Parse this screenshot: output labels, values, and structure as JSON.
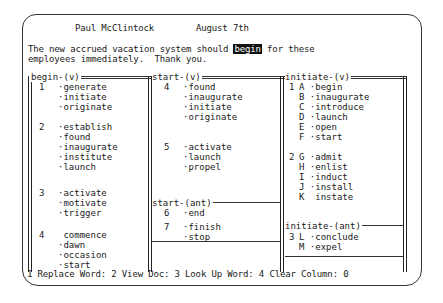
{
  "header": {
    "author": "Paul McClintock",
    "date": "August 7th"
  },
  "document": {
    "line1_before": "The new accrued vacation system should ",
    "highlighted_word": "begin",
    "line1_after": " for these",
    "line2": "employees immediately.  Thank you."
  },
  "panes": {
    "left": {
      "title": "begin-(v)",
      "groups": [
        {
          "num": "1",
          "words": [
            "generate",
            "initiate",
            "originate"
          ]
        },
        {
          "num": "2",
          "words": [
            "establish",
            "found",
            "inaugurate",
            "institute",
            "launch"
          ]
        },
        {
          "num": "3",
          "words": [
            "activate",
            "motivate",
            "trigger"
          ]
        },
        {
          "num": "4",
          "words": [
            "commence",
            "dawn",
            "occasion",
            "start"
          ]
        }
      ]
    },
    "middle": {
      "title": "start-(v)",
      "groups": [
        {
          "num": "4",
          "words": [
            "found",
            "inaugurate",
            "initiate",
            "originate"
          ]
        },
        {
          "num": "5",
          "words": [
            "activate",
            "launch",
            "propel"
          ]
        }
      ],
      "ant_title": "start-(ant)",
      "ant_groups": [
        {
          "num": "6",
          "words": [
            "end"
          ]
        },
        {
          "num": "7",
          "words": [
            "finish",
            "stop"
          ]
        }
      ]
    },
    "right": {
      "title": "initiate-(v)",
      "groups": [
        {
          "num": "1",
          "items": [
            {
              "letter": "A",
              "word": "begin"
            },
            {
              "letter": "B",
              "word": "inaugurate"
            },
            {
              "letter": "C",
              "word": "introduce"
            },
            {
              "letter": "D",
              "word": "launch"
            },
            {
              "letter": "E",
              "word": "open"
            },
            {
              "letter": "F",
              "word": "start"
            }
          ]
        },
        {
          "num": "2",
          "items": [
            {
              "letter": "G",
              "word": "admit"
            },
            {
              "letter": "H",
              "word": "enlist"
            },
            {
              "letter": "I",
              "word": "induct"
            },
            {
              "letter": "J",
              "word": "install"
            },
            {
              "letter": "K",
              "word": "instate"
            }
          ]
        }
      ],
      "ant_title": "initiate-(ant)",
      "ant_groups": [
        {
          "num": "3",
          "items": [
            {
              "letter": "L",
              "word": "conclude"
            },
            {
              "letter": "M",
              "word": "expel"
            }
          ]
        }
      ]
    }
  },
  "status_bar": {
    "f1": "1 Replace Word",
    "f2": "2 View Doc",
    "f3": "3 Look Up Word",
    "f4": "4 Clear Column",
    "column_value": "0"
  }
}
